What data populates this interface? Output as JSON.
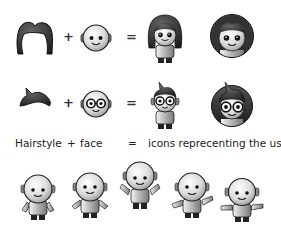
{
  "rows": [
    {
      "hairstyle": "long-hair",
      "face": "plain-face",
      "result_figure": "girl-avatar-figure",
      "result_badge": "girl-avatar-badge",
      "plus": "+",
      "equals": "="
    },
    {
      "hairstyle": "spiky-hair",
      "face": "glasses-face",
      "result_figure": "boy-glasses-avatar-figure",
      "result_badge": "boy-glasses-avatar-badge",
      "plus": "+",
      "equals": "="
    }
  ],
  "legend": {
    "hairstyle": "Hairstyle",
    "plus": "+",
    "face": "face",
    "equals": "=",
    "result": "icons reprecenting the user"
  },
  "base_figures": {
    "count": 5,
    "poses": [
      "arms-down",
      "arms-out",
      "arms-up",
      "arms-wide",
      "arms-flat"
    ]
  },
  "colors": {
    "dark": "#2a2a2a",
    "skin": "#e2e2e2",
    "outline": "#1a1a1a",
    "background": "#ffffff"
  }
}
